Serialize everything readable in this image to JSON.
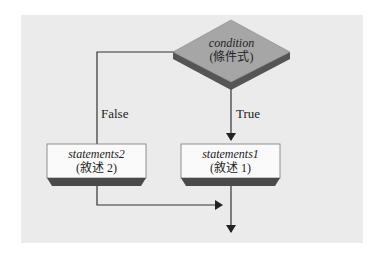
{
  "diagram": {
    "decision": {
      "line1": "condition",
      "line2": "(條件式)"
    },
    "false_label": "False",
    "true_label": "True",
    "box_false": {
      "line1": "statements2",
      "line2": "(敘述 2)"
    },
    "box_true": {
      "line1": "statements1",
      "line2": "(敘述 1)"
    }
  }
}
